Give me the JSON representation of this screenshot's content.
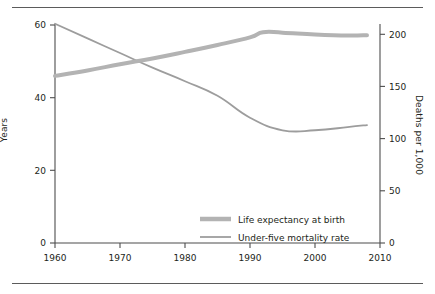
{
  "figure": {
    "has_top_rule": true,
    "has_bottom_rule": true,
    "background": "#ffffff"
  },
  "chart_data": {
    "type": "line",
    "title": "",
    "subtitle": "",
    "xlabel": "",
    "ylabel": "Years",
    "ylabel_right": "Deaths per 1,000",
    "xlim": [
      1960,
      2010
    ],
    "ylim_left": [
      0,
      60
    ],
    "ylim_right": [
      0,
      210
    ],
    "xticks": [
      1960,
      1970,
      1980,
      1990,
      2000,
      2010
    ],
    "xticklabels": [
      "1960",
      "1970",
      "1980",
      "1990",
      "2000",
      "2010"
    ],
    "yticks_left": [
      0,
      20,
      40,
      60
    ],
    "yticklabels_left": [
      "0",
      "20",
      "40",
      "60"
    ],
    "yticks_right": [
      0,
      50,
      100,
      150,
      200
    ],
    "yticklabels_right": [
      "0",
      "50",
      "100",
      "150",
      "200"
    ],
    "grid": false,
    "legend_position": "lower right",
    "series": [
      {
        "name": "Life expectancy at birth",
        "axis": "left",
        "unit": "years",
        "color": "#b3b3b3",
        "linewidth": 4,
        "x": [
          1960,
          1965,
          1970,
          1975,
          1980,
          1985,
          1990,
          1992,
          1995,
          2000,
          2005,
          2008
        ],
        "values": [
          46.0,
          47.5,
          49.2,
          50.8,
          52.6,
          54.5,
          56.6,
          58.0,
          57.9,
          57.4,
          57.1,
          57.2
        ]
      },
      {
        "name": "Under-five mortality rate",
        "axis": "right",
        "unit": "deaths per 1,000",
        "color": "#9d9d9d",
        "linewidth": 1.8,
        "x": [
          1960,
          1965,
          1970,
          1975,
          1980,
          1985,
          1990,
          1995,
          2000,
          2005,
          2008
        ],
        "values": [
          210,
          196,
          182,
          168,
          155,
          141,
          120,
          108,
          108,
          111,
          113
        ]
      }
    ],
    "crossover": {
      "year": 1972,
      "left_value": 50,
      "right_value": 175
    }
  },
  "legend": {
    "items": [
      {
        "label": "Life expectancy at birth",
        "swatch": "thick-gray-line"
      },
      {
        "label": "Under-five mortality rate",
        "swatch": "thin-gray-line"
      }
    ]
  }
}
